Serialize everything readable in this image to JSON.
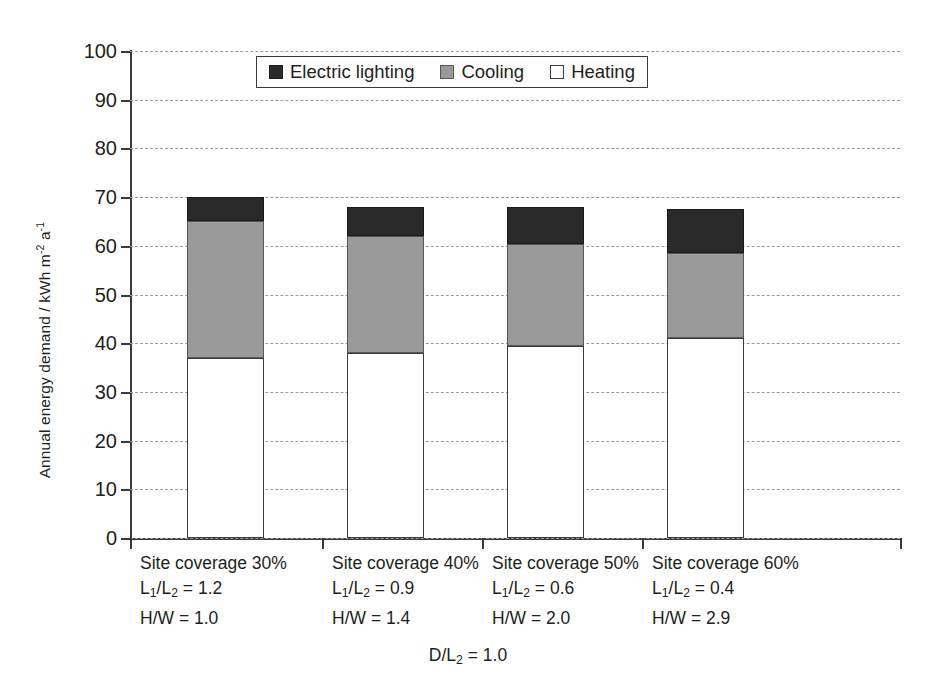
{
  "chart_data": {
    "type": "bar",
    "stacked": true,
    "title": "",
    "xlabel": "D/L2 = 1.0",
    "ylabel": "Annual energy demand / kWh m-2 a-1",
    "ylim": [
      0,
      100
    ],
    "yticks": [
      0,
      10,
      20,
      30,
      40,
      50,
      60,
      70,
      80,
      90,
      100
    ],
    "grid": true,
    "legend_position": "top-center",
    "categories": [
      "Site coverage 30%",
      "Site coverage 40%",
      "Site coverage 50%",
      "Site coverage 60%"
    ],
    "series": [
      {
        "name": "Heating",
        "color": "#ffffff",
        "values": [
          37.0,
          38.0,
          39.5,
          41.0
        ]
      },
      {
        "name": "Cooling",
        "color": "#9a9a9a",
        "values": [
          28.0,
          24.0,
          20.8,
          17.5
        ]
      },
      {
        "name": "Electric lighting",
        "color": "#2a2a2a",
        "values": [
          5.0,
          6.0,
          7.7,
          9.0
        ]
      }
    ],
    "totals": [
      70.0,
      68.0,
      68.0,
      67.5
    ]
  },
  "axis": {
    "y_title_main": "Annual energy demand / kWh m",
    "y_title_sup1": "-2",
    "y_title_mid": " a",
    "y_title_sup2": "-1",
    "ticks": [
      {
        "label": "100",
        "value": 100
      },
      {
        "label": "90",
        "value": 90
      },
      {
        "label": "80",
        "value": 80
      },
      {
        "label": "70",
        "value": 70
      },
      {
        "label": "60",
        "value": 60
      },
      {
        "label": "50",
        "value": 50
      },
      {
        "label": "40",
        "value": 40
      },
      {
        "label": "30",
        "value": 30
      },
      {
        "label": "20",
        "value": 20
      },
      {
        "label": "10",
        "value": 10
      },
      {
        "label": "0",
        "value": 0
      }
    ]
  },
  "legend": {
    "items": [
      {
        "label": "Electric lighting",
        "swatch": "lighting"
      },
      {
        "label": "Cooling",
        "swatch": "cooling"
      },
      {
        "label": "Heating",
        "swatch": "heating"
      }
    ]
  },
  "categories": [
    {
      "coverage": "Site coverage 30%",
      "ratio_prefix": "L",
      "ratio_sub1": "1",
      "ratio_mid": "/L",
      "ratio_sub2": "2",
      "ratio_value": " = 1.2",
      "hw": "H/W = 1.0"
    },
    {
      "coverage": "Site coverage 40%",
      "ratio_prefix": "L",
      "ratio_sub1": "1",
      "ratio_mid": "/L",
      "ratio_sub2": "2",
      "ratio_value": " = 0.9",
      "hw": "H/W = 1.4"
    },
    {
      "coverage": "Site coverage 50%",
      "ratio_prefix": "L",
      "ratio_sub1": "1",
      "ratio_mid": "/L",
      "ratio_sub2": "2",
      "ratio_value": " = 0.6",
      "hw": "H/W = 2.0"
    },
    {
      "coverage": "Site coverage 60%",
      "ratio_prefix": "L",
      "ratio_sub1": "1",
      "ratio_mid": "/L",
      "ratio_sub2": "2",
      "ratio_value": " = 0.4",
      "hw": "H/W = 2.9"
    }
  ],
  "caption": {
    "prefix": "D/L",
    "sub": "2",
    "suffix": " = 1.0"
  },
  "colors": {
    "lighting": "#2a2a2a",
    "cooling": "#9a9a9a",
    "heating": "#ffffff",
    "axis": "#3a3a3a",
    "grid": "#9b9b9b",
    "text": "#231f20"
  }
}
